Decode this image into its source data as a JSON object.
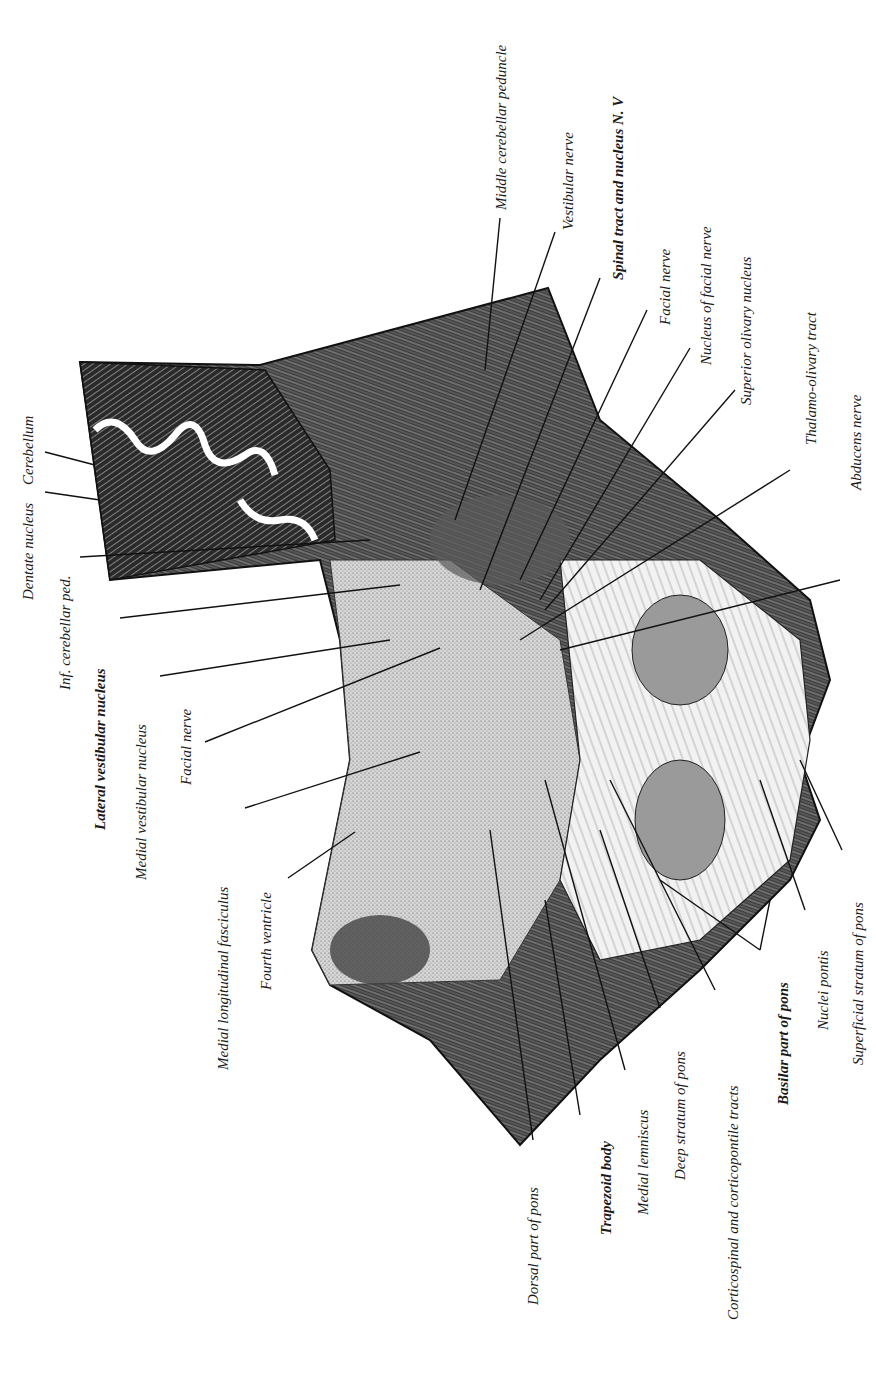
{
  "figure": {
    "orientation": "rotated 90 degrees counter-clockwise"
  },
  "labels": {
    "left": [
      {
        "id": "cerebellum",
        "text": "Cerebellum"
      },
      {
        "id": "dentate_nucleus",
        "text": "Dentate nucleus"
      },
      {
        "id": "inf_cerebellar_ped",
        "text": "Inf. cerebellar ped."
      },
      {
        "id": "lateral_vestibular_nucleus",
        "text": "Lateral vestibular nucleus"
      },
      {
        "id": "medial_vestibular_nucleus",
        "text": "Medial vestibular nucleus"
      },
      {
        "id": "facial_nerve_left",
        "text": "Facial nerve"
      },
      {
        "id": "medial_longitudinal_fasciculus",
        "text": "Medial longitudinal fasciculus"
      },
      {
        "id": "fourth_ventricle",
        "text": "Fourth ventricle"
      }
    ],
    "top_right": [
      {
        "id": "middle_cerebellar_peduncle",
        "text": "Middle cerebellar peduncle"
      },
      {
        "id": "vestibular_nerve",
        "text": "Vestibular nerve"
      },
      {
        "id": "spinal_tract_nv",
        "text": "Spinal tract and nucleus N. V"
      },
      {
        "id": "facial_nerve_right",
        "text": "Facial nerve"
      },
      {
        "id": "nucleus_of_facial_nerve",
        "text": "Nucleus of facial nerve"
      },
      {
        "id": "superior_olivary_nucleus",
        "text": "Superior olivary nucleus"
      },
      {
        "id": "thalamo_olivary_tract",
        "text": "Thalamo-olivary tract"
      },
      {
        "id": "abducens_nerve",
        "text": "Abducens nerve"
      }
    ],
    "bottom": [
      {
        "id": "dorsal_part_of_pons",
        "text": "Dorsal part of pons"
      },
      {
        "id": "trapezoid_body",
        "text": "Trapezoid body"
      },
      {
        "id": "medial_lemniscus",
        "text": "Medial lemniscus"
      },
      {
        "id": "deep_stratum_of_pons",
        "text": "Deep stratum of pons"
      },
      {
        "id": "corticospinal_tracts",
        "text": "Corticospinal and corticopontile tracts"
      },
      {
        "id": "basilar_part_of_pons",
        "text": "Basilar part of pons"
      },
      {
        "id": "nuclei_pontis",
        "text": "Nuclei pontis"
      },
      {
        "id": "superficial_stratum_of_pons",
        "text": "Superficial stratum of pons"
      }
    ]
  }
}
